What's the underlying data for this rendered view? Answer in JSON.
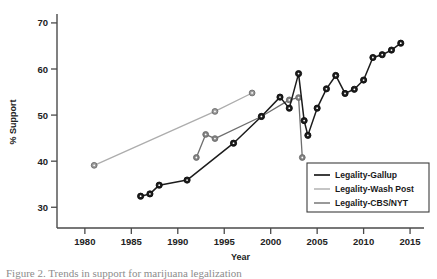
{
  "chart_data": {
    "type": "line",
    "title": "",
    "xlabel": "Year",
    "ylabel": "% Support",
    "xlim": [
      1977,
      2016.5
    ],
    "ylim": [
      25.5,
      71.5
    ],
    "grid": false,
    "legend_position": "bottom-right",
    "xticks": [
      1980,
      1985,
      1990,
      1995,
      2000,
      2005,
      2010,
      2015
    ],
    "yticks": [
      30,
      40,
      50,
      60,
      70
    ],
    "series": [
      {
        "name": "Legality-Gallup",
        "color": "#1c1c1c",
        "marker_color": "#1c1c1c",
        "points": [
          [
            1986,
            32.4
          ],
          [
            1987,
            32.9
          ],
          [
            1988,
            34.8
          ],
          [
            1991,
            35.9
          ],
          [
            1996,
            43.9
          ],
          [
            1999,
            49.7
          ],
          [
            2001,
            53.9
          ],
          [
            2002,
            51.5
          ],
          [
            2003,
            59.0
          ],
          [
            2003.6,
            48.8
          ],
          [
            2004,
            45.6
          ],
          [
            2005,
            51.5
          ],
          [
            2006,
            55.7
          ],
          [
            2007,
            58.6
          ],
          [
            2008,
            54.7
          ],
          [
            2009,
            55.6
          ],
          [
            2010,
            57.6
          ],
          [
            2011,
            62.5
          ],
          [
            2012,
            63.1
          ],
          [
            2013,
            64.1
          ],
          [
            2014,
            65.6
          ]
        ]
      },
      {
        "name": "Legality-Wash Post",
        "color": "#adadad",
        "marker_color": "#9a9a9a",
        "points": [
          [
            1981,
            39.1
          ],
          [
            1994,
            50.8
          ],
          [
            1998,
            54.8
          ]
        ]
      },
      {
        "name": "Legality-CBS/NYT",
        "color": "#6e6e6e",
        "marker_color": "#828282",
        "points": [
          [
            1992,
            40.8
          ],
          [
            1993,
            45.8
          ],
          [
            1994,
            44.9
          ],
          [
            1999,
            49.7
          ],
          [
            2002,
            53.3
          ],
          [
            2003,
            53.8
          ],
          [
            2003.4,
            40.8
          ]
        ]
      }
    ]
  },
  "legend": {
    "entries": [
      {
        "label": "Legality-Gallup"
      },
      {
        "label": "Legality-Wash Post"
      },
      {
        "label": "Legality-CBS/NYT"
      }
    ]
  },
  "caption": {
    "text": "Figure 2. Trends in support for marijuana legalization"
  }
}
